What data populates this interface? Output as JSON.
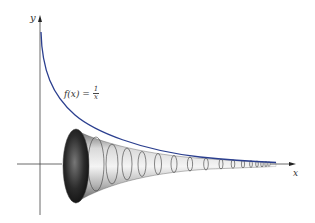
{
  "figure": {
    "axes": {
      "x_label": "x",
      "y_label": "y"
    },
    "function_label": {
      "lhs": "f(x) =",
      "numerator": "1",
      "denominator": "x"
    },
    "colors": {
      "curve": "#2b3f8f",
      "axis": "#333333",
      "horn_dark": "#2a2a2a",
      "horn_light": "#e8e8e8"
    }
  }
}
